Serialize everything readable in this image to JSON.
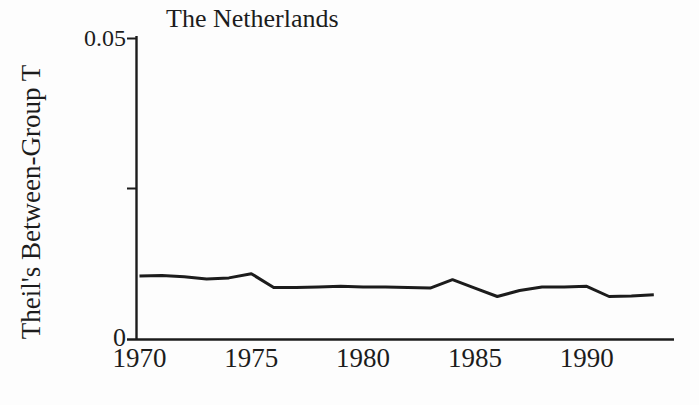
{
  "chart_data": {
    "type": "line",
    "title": "The Netherlands",
    "ylabel": "Theil's Between-Group T",
    "xlabel": "",
    "x": [
      1970,
      1971,
      1972,
      1973,
      1974,
      1975,
      1976,
      1977,
      1978,
      1979,
      1980,
      1981,
      1982,
      1983,
      1984,
      1985,
      1986,
      1987,
      1988,
      1989,
      1990,
      1991,
      1992,
      1993
    ],
    "series": [
      {
        "name": "Theil's Between-Group T",
        "values": [
          0.0104,
          0.0105,
          0.0103,
          0.0099,
          0.0101,
          0.0108,
          0.0085,
          0.0085,
          0.0086,
          0.0087,
          0.0086,
          0.0086,
          0.0085,
          0.0084,
          0.0098,
          0.0084,
          0.007,
          0.008,
          0.0086,
          0.0086,
          0.0087,
          0.007,
          0.0071,
          0.0073
        ]
      }
    ],
    "ylim": [
      0,
      0.05
    ],
    "xlim": [
      1970,
      1994
    ],
    "yticks": [
      0,
      0.025,
      0.05
    ],
    "ytick_labels": [
      "0",
      "",
      "0.05"
    ],
    "xticks": [
      1970,
      1975,
      1980,
      1985,
      1990
    ],
    "xtick_labels": [
      "1970",
      "1975",
      "1980",
      "1985",
      "1990"
    ],
    "grid": false,
    "legend": "none",
    "line_color": "#1c1c1c",
    "axis_color": "#1c1c1c",
    "background_color": "#fdfdfd"
  }
}
